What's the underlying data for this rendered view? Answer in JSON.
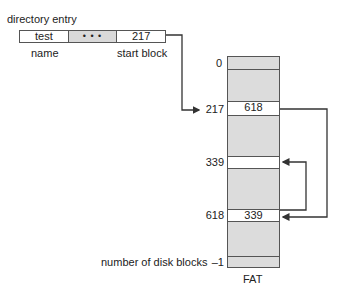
{
  "diagram": {
    "title": "directory entry",
    "directory_entry": {
      "cells": [
        {
          "value": "test",
          "shaded": false
        },
        {
          "value": "• • •",
          "shaded": true
        },
        {
          "value": "217",
          "shaded": false
        }
      ],
      "labels": {
        "name": "name",
        "start_block": "start block"
      }
    },
    "fat": {
      "caption": "FAT",
      "indices": {
        "first": "0",
        "r217": "217",
        "r339": "339",
        "r618": "618",
        "last": "–1"
      },
      "rows": {
        "r217_value": "618",
        "r339_value": "",
        "r618_value": "339"
      },
      "last_label": "number of disk blocks"
    },
    "colors": {
      "line": "#333333",
      "shade": "#dcdcdc"
    }
  }
}
